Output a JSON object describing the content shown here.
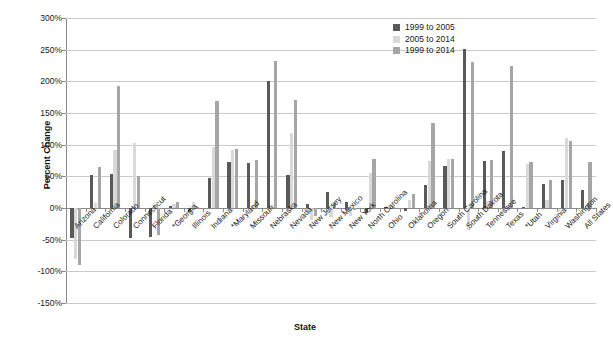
{
  "chart_data": {
    "type": "bar",
    "title": "",
    "xlabel": "State",
    "ylabel": "Percent Change",
    "ylim": [
      -150,
      300
    ],
    "ytick_step": 50,
    "ytick_labels": [
      "300%",
      "250%",
      "200%",
      "150%",
      "100%",
      "50%",
      "0%",
      "-50%",
      "-100%",
      "-150%"
    ],
    "ytick_values": [
      300,
      250,
      200,
      150,
      100,
      50,
      0,
      -50,
      -100,
      -150
    ],
    "grid": true,
    "legend_position": "top-right-inside",
    "categories": [
      "Arizona",
      "California",
      "Colorado",
      "Connecticut",
      "Florida",
      "*Georgia",
      "Illinois",
      "Indiana",
      "*Maryland",
      "Missouri",
      "Nebraska",
      "Nevada",
      "New Jersey",
      "New Mexico",
      "New York",
      "North Carolina",
      "Ohio",
      "Oklahoma",
      "Oregon",
      "South Carolina",
      "South Dakota",
      "Tennessee",
      "Texas",
      "*Utah",
      "Virginia",
      "Washington",
      "All States"
    ],
    "series": [
      {
        "name": "1999 to 2005",
        "color": "#595959",
        "values": [
          -48,
          52,
          54,
          -47,
          -45,
          3,
          -6,
          47,
          72,
          71,
          200,
          52,
          7,
          25,
          10,
          -8,
          1,
          -5,
          37,
          66,
          251,
          75,
          90,
          2,
          38,
          44,
          28
        ]
      },
      {
        "name": "2005 to 2014",
        "color": "#d9d9d9",
        "values": [
          -80,
          8,
          92,
          102,
          4,
          7,
          9,
          96,
          91,
          3,
          4,
          118,
          -19,
          -14,
          -12,
          55,
          1,
          13,
          74,
          77,
          -34,
          11,
          5,
          70,
          12,
          111,
          6
        ]
      },
      {
        "name": "1999 to 2014",
        "color": "#a6a6a6",
        "values": [
          -90,
          64,
          192,
          51,
          -43,
          10,
          2,
          169,
          93,
          76,
          232,
          171,
          -13,
          8,
          -3,
          77,
          2,
          22,
          135,
          77,
          230,
          76,
          224,
          72,
          45,
          106,
          73
        ]
      }
    ]
  },
  "legend": {
    "items": [
      {
        "label": "1999 to 2005",
        "color": "#595959"
      },
      {
        "label": "2005 to 2014",
        "color": "#d9d9d9"
      },
      {
        "label": "1999 to 2014",
        "color": "#a6a6a6"
      }
    ]
  },
  "axes": {
    "y_title": "Percent Change",
    "x_title": "State"
  }
}
